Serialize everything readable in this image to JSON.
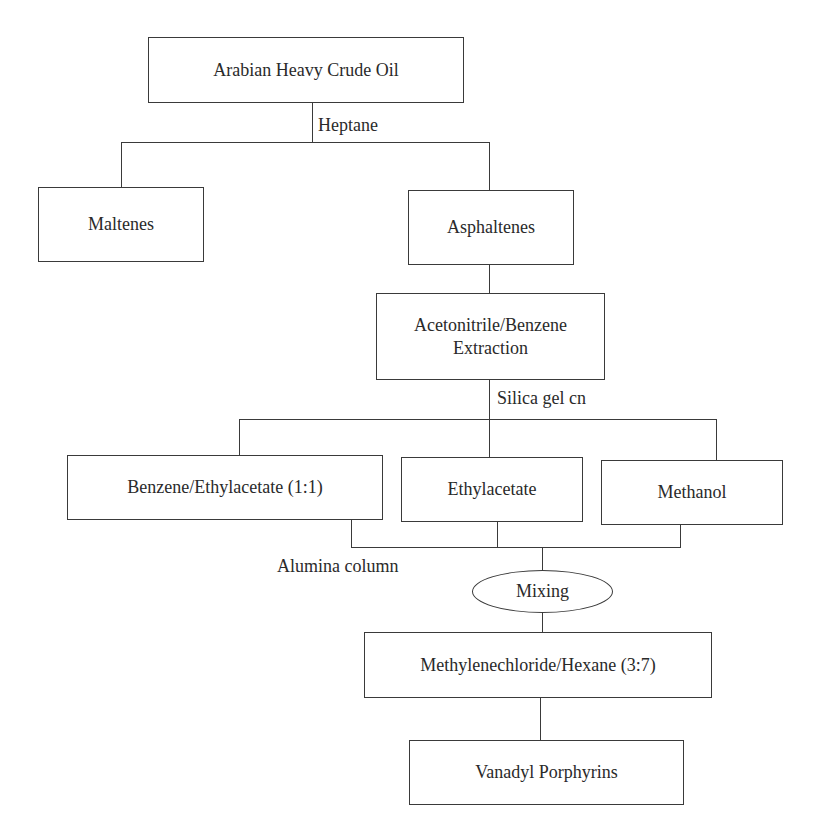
{
  "diagram": {
    "type": "flowchart",
    "nodes": {
      "crude_oil": "Arabian Heavy Crude Oil",
      "maltenes": "Maltenes",
      "asphaltenes": "Asphaltenes",
      "extraction_line1": "Acetonitrile/Benzene",
      "extraction_line2": "Extraction",
      "benzene_ethylacetate": "Benzene/Ethylacetate (1:1)",
      "ethylacetate": "Ethylacetate",
      "methanol": "Methanol",
      "mixing": "Mixing",
      "methylenechloride_hexane": "Methylenechloride/Hexane (3:7)",
      "vanadyl_porphyrins": "Vanadyl Porphyrins"
    },
    "edge_labels": {
      "heptane": "Heptane",
      "silica_gel": "Silica gel cn",
      "alumina_column": "Alumina column"
    },
    "edges": [
      [
        "crude_oil",
        "maltenes",
        "heptane"
      ],
      [
        "crude_oil",
        "asphaltenes",
        "heptane"
      ],
      [
        "asphaltenes",
        "extraction"
      ],
      [
        "extraction",
        "benzene_ethylacetate",
        "silica_gel"
      ],
      [
        "extraction",
        "ethylacetate",
        "silica_gel"
      ],
      [
        "extraction",
        "methanol",
        "silica_gel"
      ],
      [
        "benzene_ethylacetate",
        "mixing",
        "alumina_column"
      ],
      [
        "ethylacetate",
        "mixing",
        "alumina_column"
      ],
      [
        "methanol",
        "mixing",
        "alumina_column"
      ],
      [
        "mixing",
        "methylenechloride_hexane"
      ],
      [
        "methylenechloride_hexane",
        "vanadyl_porphyrins"
      ]
    ]
  }
}
